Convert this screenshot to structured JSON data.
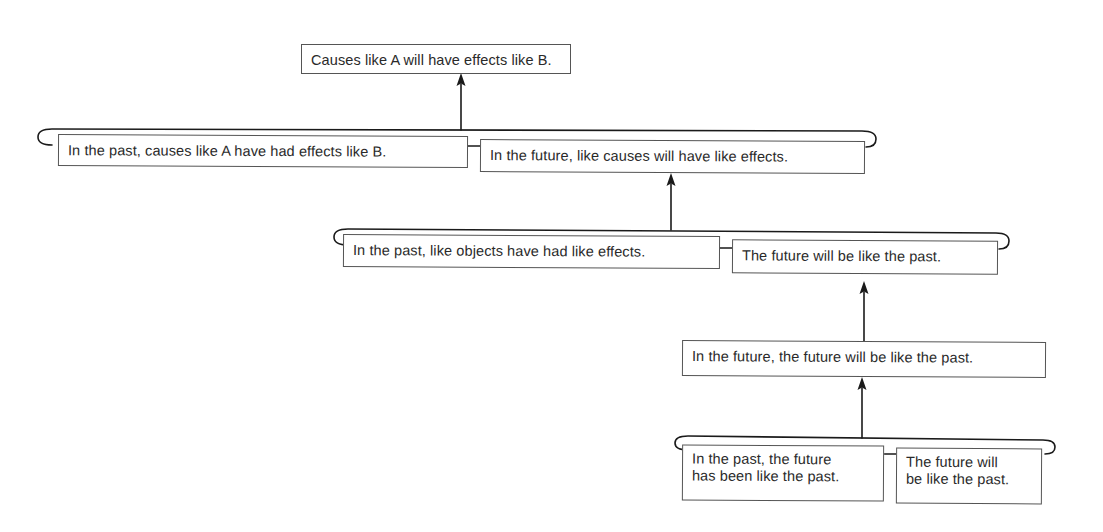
{
  "diagram": {
    "type": "argument-tree",
    "nodes": {
      "conclusion": {
        "text": "Causes like A will have effects like B."
      },
      "level1_left": {
        "text": "In the past, causes like A have had effects like B."
      },
      "level1_right": {
        "text": "In the future, like causes will have like effects."
      },
      "level2_left": {
        "text": "In the past, like objects have had like effects."
      },
      "level2_right": {
        "text": "The future will be like the past."
      },
      "level3": {
        "text": "In the future, the future will be like the past."
      },
      "level4_left": {
        "line1": "In the past, the future",
        "line2": "has been like the past."
      },
      "level4_right": {
        "line1": "The future will",
        "line2": "be like the past."
      }
    },
    "edges": [
      {
        "from": [
          "level1_left",
          "level1_right"
        ],
        "to": "conclusion"
      },
      {
        "from": [
          "level2_left",
          "level2_right"
        ],
        "to": "level1_right"
      },
      {
        "from": [
          "level3"
        ],
        "to": "level2_right"
      },
      {
        "from": [
          "level4_left",
          "level4_right"
        ],
        "to": "level3"
      }
    ],
    "colors": {
      "line": "#1a1a1a",
      "box_border": "#555555",
      "text": "#2a2a2a",
      "background": "#ffffff"
    }
  }
}
